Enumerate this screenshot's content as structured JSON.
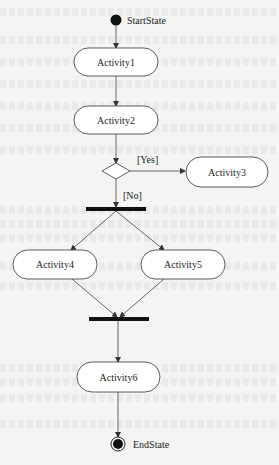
{
  "diagram": {
    "type": "UML activity diagram",
    "colors": {
      "stroke": "#333333",
      "fill": "#ffffff",
      "bar": "#111111",
      "background": "#f4f4f2"
    },
    "start": {
      "label": "StartState"
    },
    "end": {
      "label": "EndState"
    },
    "activities": [
      {
        "id": "a1",
        "label": "Activity1"
      },
      {
        "id": "a2",
        "label": "Activity2"
      },
      {
        "id": "a3",
        "label": "Activity3"
      },
      {
        "id": "a4",
        "label": "Activity4"
      },
      {
        "id": "a5",
        "label": "Activity5"
      },
      {
        "id": "a6",
        "label": "Activity6"
      }
    ],
    "decision": {
      "guards": {
        "yes": "[Yes]",
        "no": "[No]"
      }
    },
    "edges": [
      {
        "from": "StartState",
        "to": "Activity1"
      },
      {
        "from": "Activity1",
        "to": "Activity2"
      },
      {
        "from": "Activity2",
        "to": "decision"
      },
      {
        "from": "decision",
        "to": "Activity3",
        "guard": "[Yes]"
      },
      {
        "from": "decision",
        "to": "fork",
        "guard": "[No]"
      },
      {
        "from": "fork",
        "to": "Activity4"
      },
      {
        "from": "fork",
        "to": "Activity5"
      },
      {
        "from": "Activity4",
        "to": "join"
      },
      {
        "from": "Activity5",
        "to": "join"
      },
      {
        "from": "join",
        "to": "Activity6"
      },
      {
        "from": "Activity6",
        "to": "EndState"
      }
    ]
  }
}
